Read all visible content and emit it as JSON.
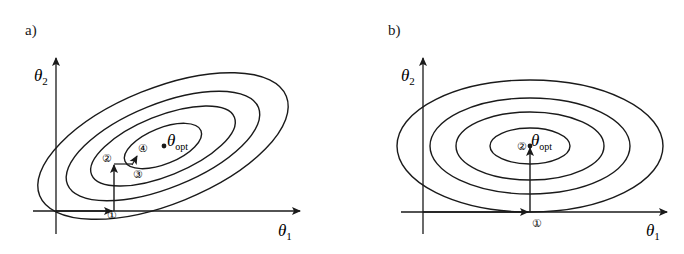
{
  "figure": {
    "panels": [
      {
        "id": "a",
        "label": "a)",
        "x_axis_label": "θ",
        "x_axis_sub": "1",
        "y_axis_label": "θ",
        "y_axis_sub": "2",
        "optimum_label": "θ",
        "optimum_sub": "opt",
        "step_markers": [
          "①",
          "②",
          "③",
          "④"
        ],
        "contour_count": 4,
        "contour_orientation": "tilted (correlated parameters)"
      },
      {
        "id": "b",
        "label": "b)",
        "x_axis_label": "θ",
        "x_axis_sub": "1",
        "y_axis_label": "θ",
        "y_axis_sub": "2",
        "optimum_label": "θ",
        "optimum_sub": "opt",
        "step_markers": [
          "①",
          "②"
        ],
        "contour_count": 4,
        "contour_orientation": "axis-aligned (uncorrelated parameters)"
      }
    ],
    "colors": {
      "ink": "#1a1a1a",
      "background": "#ffffff"
    }
  }
}
